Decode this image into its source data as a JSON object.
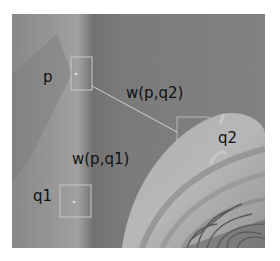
{
  "figure": {
    "patches": [
      {
        "id": "p",
        "label": "p"
      },
      {
        "id": "q1",
        "label": "q1"
      },
      {
        "id": "q2",
        "label": "q2"
      }
    ],
    "weights": [
      {
        "id": "w_p_q2",
        "label": "w(p,q2)"
      },
      {
        "id": "w_p_q1",
        "label": "w(p,q1)"
      }
    ],
    "colors": {
      "box_outline": "#c8c8c8",
      "text": "#111111"
    }
  }
}
